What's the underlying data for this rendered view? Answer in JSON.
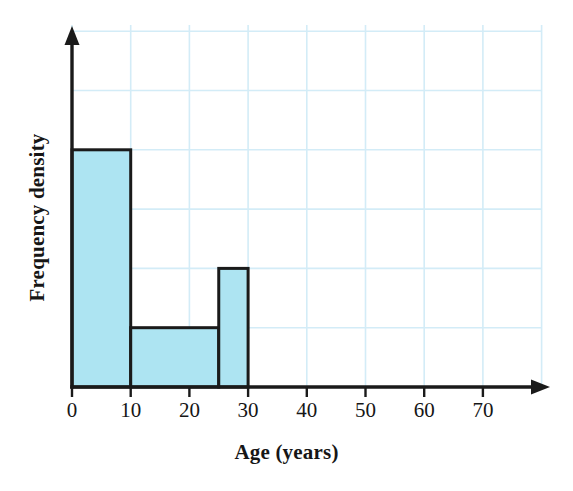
{
  "figure": {
    "kind": "histogram-figure",
    "width": 573,
    "height": 491,
    "background": "#ffffff"
  },
  "axes": {
    "x_title": "Age (years)",
    "y_title": "Frequency density",
    "x_tick_labels": [
      "0",
      "10",
      "20",
      "30",
      "40",
      "50",
      "60",
      "70"
    ],
    "y_tick_labels": [],
    "x_arrow": true,
    "y_arrow": true
  },
  "colors": {
    "bar_fill": "#ade4f2",
    "bar_stroke": "#1a1a1a",
    "axis": "#1a1a1a",
    "grid": "#d3ecf7",
    "text": "#161616",
    "background": "#ffffff"
  },
  "chart_data": {
    "type": "bar",
    "title": "",
    "subtitle": "",
    "xlabel": "Age (years)",
    "ylabel": "Frequency density",
    "xlim": [
      0,
      80
    ],
    "ylim": [
      0,
      6
    ],
    "xticks": [
      0,
      10,
      20,
      30,
      40,
      50,
      60,
      70
    ],
    "yticks": [],
    "grid": true,
    "grid_x_step": 10,
    "grid_y_step": 1,
    "legend": false,
    "legend_position": "none",
    "categories": [
      "0-10",
      "10-25",
      "25-30"
    ],
    "values": [
      4,
      1,
      2
    ],
    "bins": [
      {
        "label": "0-10",
        "start": 0,
        "end": 10,
        "frequency_density": 4
      },
      {
        "label": "10-25",
        "start": 10,
        "end": 25,
        "frequency_density": 1
      },
      {
        "label": "25-30",
        "start": 25,
        "end": 30,
        "frequency_density": 2
      }
    ],
    "annotations": []
  }
}
